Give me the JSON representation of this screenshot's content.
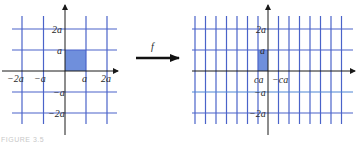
{
  "figure": {
    "caption_fragment": "FIGURE 3.5",
    "map_label": "f",
    "colors": {
      "grid": "#4a63c9",
      "grid_alt": "#5fa0d8",
      "square_fill": "#6f8fdc",
      "axis": "#1a1a1a",
      "arrow": "#111111"
    }
  },
  "left_plot": {
    "name": "domain-grid",
    "x_tick_labels": [
      "−2a",
      "−a",
      "a",
      "2a"
    ],
    "y_tick_labels": [
      "2a",
      "a",
      "−a",
      "−2a"
    ],
    "shaded_square": "[0,a] × [0,a]"
  },
  "right_plot": {
    "name": "image-grid",
    "x_tick_labels": [
      "ca",
      "−ca"
    ],
    "y_tick_labels": [
      "2a",
      "a",
      "−a",
      "−2a"
    ],
    "shaded_square": "[−ca,0] × [0,a]"
  }
}
